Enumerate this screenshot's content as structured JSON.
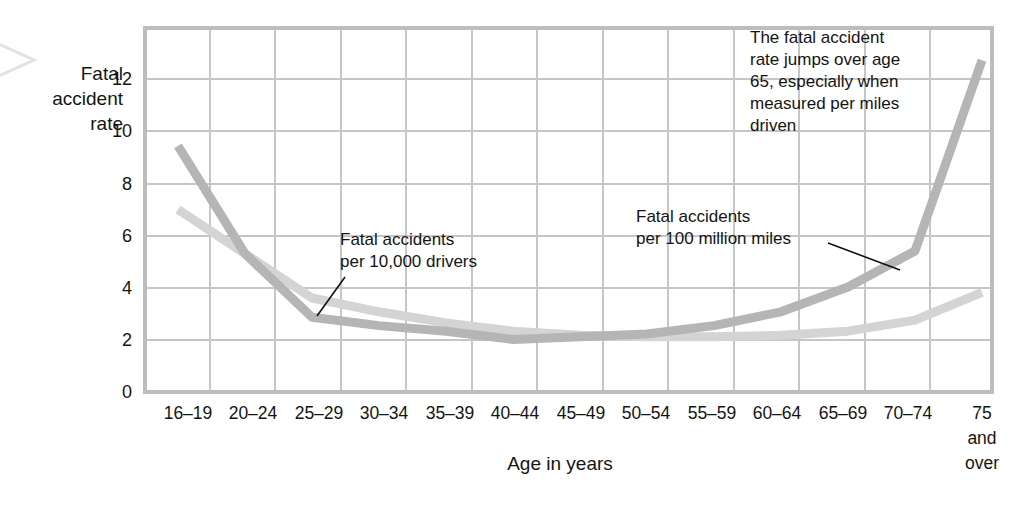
{
  "chart_data": {
    "type": "line",
    "title": "",
    "xlabel": "Age in years",
    "ylabel": "Fatal accident rate",
    "ylabel_lines": [
      "Fatal",
      "accident",
      "rate"
    ],
    "categories": [
      "16–19",
      "20–24",
      "25–29",
      "30–34",
      "35–39",
      "40–44",
      "45–49",
      "50–54",
      "55–59",
      "60–64",
      "65–69",
      "70–74",
      "75 and over"
    ],
    "category_last_lines": [
      "75",
      "and",
      "over"
    ],
    "yticks": [
      0,
      2,
      4,
      6,
      8,
      10,
      12
    ],
    "ytick_labels": [
      "0",
      "2",
      "4",
      "6",
      "8",
      "10",
      "12"
    ],
    "ylim": [
      0,
      13.2
    ],
    "grid": true,
    "legend": "annotations",
    "series": [
      {
        "name": "Fatal accidents per 100 million miles",
        "color": "#b5b5b5",
        "values": [
          8.9,
          5.0,
          2.7,
          2.4,
          2.2,
          1.9,
          2.0,
          2.1,
          2.4,
          2.9,
          3.8,
          5.1,
          12.0
        ]
      },
      {
        "name": "Fatal accidents per 10,000 drivers",
        "color": "#d4d4d4",
        "values": [
          6.6,
          5.0,
          3.4,
          2.9,
          2.5,
          2.2,
          2.05,
          2.0,
          2.0,
          2.05,
          2.2,
          2.6,
          3.6
        ]
      }
    ],
    "annotations": [
      {
        "id": "annotation-drivers",
        "lines": [
          "Fatal accidents",
          "per 10,000 drivers"
        ]
      },
      {
        "id": "annotation-miles",
        "lines": [
          "Fatal accidents",
          "per 100 million miles"
        ]
      },
      {
        "id": "annotation-callout",
        "lines": [
          "The fatal accident",
          "rate jumps over age",
          "65, especially when",
          "measured per miles",
          "driven"
        ]
      }
    ]
  }
}
